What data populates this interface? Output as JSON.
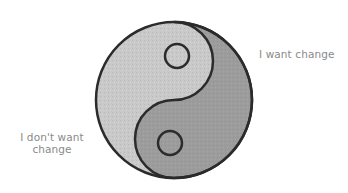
{
  "diagram": {
    "type": "yin-yang",
    "colors": {
      "light_half": "#c9c9c9",
      "dark_half": "#9a9a9a",
      "outline": "#2b2b2b",
      "label_text": "#8a8a8a",
      "background": "#ffffff"
    },
    "labels": {
      "right": "I want change",
      "left_line1": "I don't want",
      "left_line2": "change"
    }
  }
}
